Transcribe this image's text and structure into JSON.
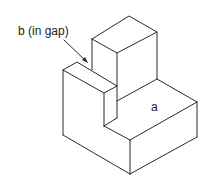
{
  "diagram": {
    "type": "isometric-solid",
    "labels": {
      "b": "b (in gap)",
      "a": "a"
    },
    "colors": {
      "stroke": "#2a2a2a",
      "background": "#ffffff"
    }
  }
}
